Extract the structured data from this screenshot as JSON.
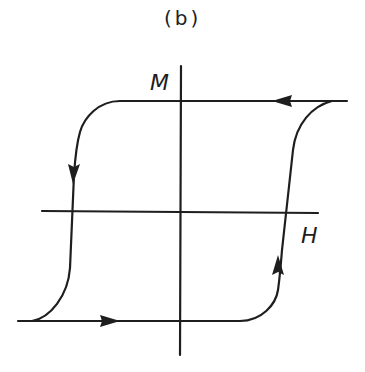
{
  "figure": {
    "panel_label": "(b)",
    "y_axis_label": "M",
    "x_axis_label": "H",
    "stroke_color": "#1e1e1e",
    "background_color": "#ffffff",
    "arrows": [
      {
        "location": "top saturation line",
        "direction": "left"
      },
      {
        "location": "left descending branch",
        "direction": "down"
      },
      {
        "location": "bottom saturation line",
        "direction": "right"
      },
      {
        "location": "right ascending branch",
        "direction": "up"
      }
    ]
  }
}
